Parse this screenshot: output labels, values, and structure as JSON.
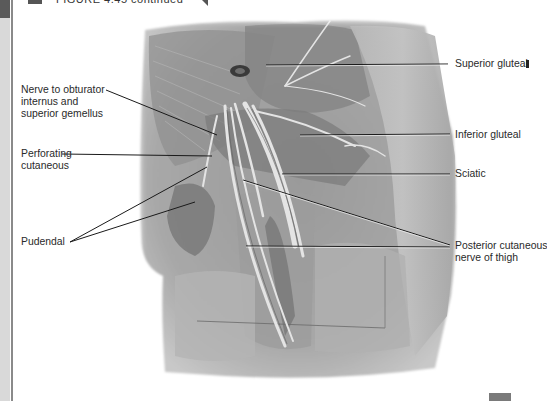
{
  "header": {
    "figure_title": "FIGURE 4.45 continued"
  },
  "labels": {
    "left": [
      {
        "id": "obturator",
        "lines": [
          "Nerve to obturator",
          "internus and",
          "superior gemellus"
        ]
      },
      {
        "id": "perforating",
        "lines": [
          "Perforating",
          "cutaneous"
        ]
      },
      {
        "id": "pudendal",
        "lines": [
          "Pudendal"
        ]
      }
    ],
    "right": [
      {
        "id": "superior-gluteal",
        "lines": [
          "Superior gluteal"
        ]
      },
      {
        "id": "inferior-gluteal",
        "lines": [
          "Inferior gluteal"
        ]
      },
      {
        "id": "sciatic",
        "lines": [
          "Sciatic"
        ]
      },
      {
        "id": "posterior-cutaneous",
        "lines": [
          "Posterior cutaneous",
          "nerve of thigh"
        ]
      }
    ]
  },
  "image": {
    "description": "Cadaveric dissection photograph of gluteal region showing nerves",
    "tone": "grayscale"
  },
  "colors": {
    "leader_line": "#1a1a1a",
    "text": "#2a2a2a",
    "side_strip": "#d9d9d9",
    "side_rule": "#8a8a8a"
  }
}
